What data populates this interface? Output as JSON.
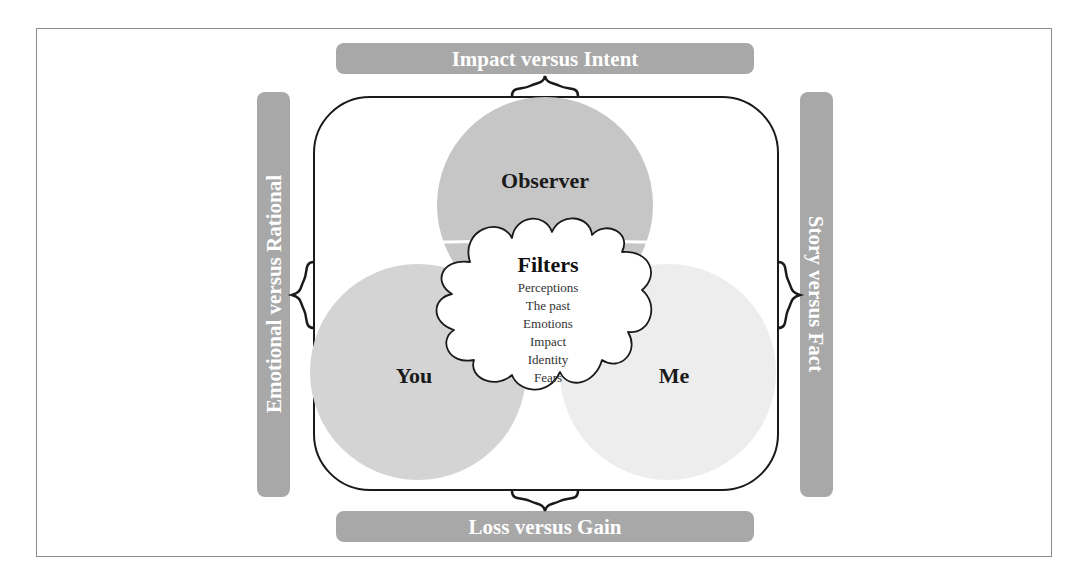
{
  "diagram": {
    "colors": {
      "banner": "#a8a8a8",
      "banner_text": "#ffffff",
      "observer_circle": "#c6c6c6",
      "you_circle": "#d4d4d4",
      "me_circle": "#ededed",
      "overlap": "#b0b0b0",
      "outline": "#1a1a1a"
    },
    "banners": {
      "top": "Impact versus Intent",
      "bottom": "Loss versus Gain",
      "left": "Emotional versus Rational",
      "right": "Story versus Fact"
    },
    "circles": {
      "observer": "Observer",
      "you": "You",
      "me": "Me"
    },
    "filters": {
      "title": "Filters",
      "items": [
        "Perceptions",
        "The past",
        "Emotions",
        "Impact",
        "Identity",
        "Fears"
      ]
    }
  }
}
